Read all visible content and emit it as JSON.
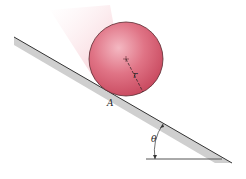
{
  "diagram": {
    "labels": {
      "contact_point": "A",
      "radius": "r",
      "angle": "θ"
    },
    "colors": {
      "ball": "#d9546a",
      "ball_highlight": "#f4b8c2",
      "incline_shadow": "#c9c9c9",
      "line": "#333333"
    }
  }
}
